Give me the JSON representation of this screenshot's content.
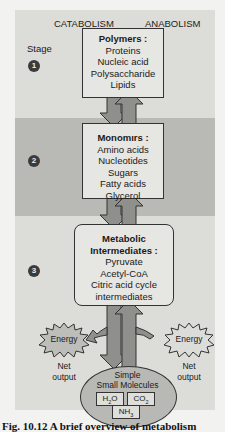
{
  "header": {
    "left": "CATABOLISM",
    "right": "ANABOLISM",
    "stage_label": "Stage"
  },
  "stages": [
    {
      "number": "1",
      "title": "Polymers :",
      "items": [
        "Proteins",
        "Nucleic acid",
        "Polysaccharide",
        "Lipids"
      ]
    },
    {
      "number": "2",
      "title": "Monomırs :",
      "items": [
        "Amino acids",
        "Nucleotides",
        "Sugars",
        "Fatty acids",
        "Glycerol"
      ]
    },
    {
      "number": "3",
      "title_line1": "Metabolic",
      "title_line2": "Intermediates :",
      "items": [
        "Pyruvate",
        "Acetyl-CoA",
        "Citric acid cycle",
        "intermediates"
      ]
    }
  ],
  "energy": {
    "left_label": "Energy",
    "right_label": "Energy",
    "net_line1": "Net",
    "net_line2": "output"
  },
  "simple": {
    "line1": "Simple",
    "line2": "Small Molecules",
    "molecules": [
      {
        "base": "H",
        "sub": "2",
        "rest": "O"
      },
      {
        "base": "CO",
        "sub": "2",
        "rest": ""
      },
      {
        "base": "NH",
        "sub": "3",
        "rest": ""
      }
    ]
  },
  "caption": "Fig. 10.12  A brief overview of metabolism",
  "colors": {
    "panel_light": "#dcdcd8",
    "panel_dark": "#b9b9b6",
    "box_fill": "#e6e6e2",
    "arrow_fill": "#8f8f8c",
    "ellipse_fill": "#b8b8b4"
  }
}
